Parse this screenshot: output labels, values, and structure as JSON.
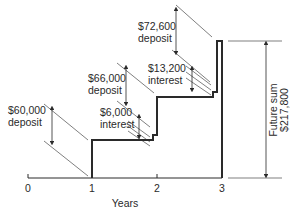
{
  "diagram": {
    "type": "cash-flow step diagram",
    "x_axis": {
      "label": "Years",
      "ticks": [
        "0",
        "1",
        "2",
        "3"
      ]
    },
    "annotations": {
      "deposit_1": {
        "amount": "$60,000",
        "label": "deposit"
      },
      "interest_1": {
        "amount": "$6,000",
        "label": "interest"
      },
      "deposit_2": {
        "amount": "$66,000",
        "label": "deposit"
      },
      "interest_2": {
        "amount": "$13,200",
        "label": "interest"
      },
      "deposit_3": {
        "amount": "$72,600",
        "label": "deposit"
      },
      "future_sum": {
        "label": "Future sum",
        "amount": "$217,800"
      }
    },
    "colors": {
      "line": "#2a2a2a",
      "background": "#ffffff"
    }
  }
}
